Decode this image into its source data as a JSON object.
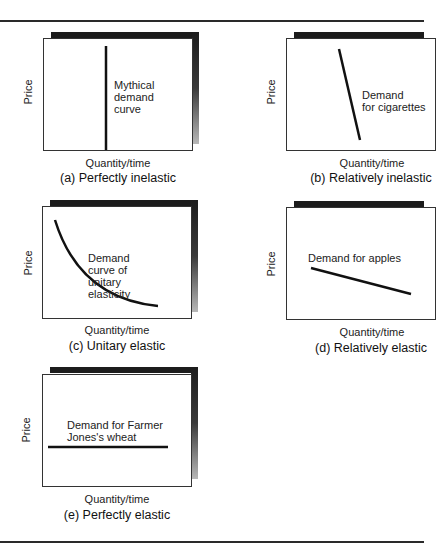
{
  "figure": {
    "axis_labels": {
      "y": "Price",
      "x": "Quantity/time"
    },
    "panels": [
      {
        "id": "a",
        "caption": "(a) Perfectly inelastic",
        "annotation": [
          "Mythical",
          "demand",
          "curve"
        ],
        "curve_type": "vertical line"
      },
      {
        "id": "b",
        "caption": "(b) Relatively inelastic",
        "annotation": [
          "Demand",
          "for cigarettes"
        ],
        "curve_type": "steep downward line"
      },
      {
        "id": "c",
        "caption": "(c) Unitary elastic",
        "annotation": [
          "Demand curve of",
          "unitary elasticity"
        ],
        "curve_type": "rectangular hyperbola"
      },
      {
        "id": "d",
        "caption": "(d) Relatively elastic",
        "annotation": [
          "Demand for apples"
        ],
        "curve_type": "shallow downward line"
      },
      {
        "id": "e",
        "caption": "(e) Perfectly elastic",
        "annotation": [
          "Demand for Farmer",
          "Jones's wheat"
        ],
        "curve_type": "horizontal line"
      }
    ]
  },
  "colors": {
    "line": "#111111",
    "shadow": "#1c1c1c",
    "frame": "#333333",
    "background": "#ffffff"
  }
}
